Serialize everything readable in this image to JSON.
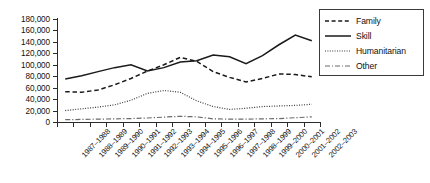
{
  "chart_data": {
    "type": "line",
    "title": "",
    "xlabel": "",
    "ylabel": "",
    "ylim": [
      0,
      180000
    ],
    "ytick_step": 20000,
    "grid": false,
    "legend_position": "right-top",
    "yticks": [
      "180,000",
      "160,000",
      "140,000",
      "120,000",
      "100,000",
      "80,000",
      "60,000",
      "40,000",
      "20,000",
      "0"
    ],
    "categories": [
      "1987–1988",
      "1988–1989",
      "1989–1990",
      "1990–1991",
      "1991–1992",
      "1992–1993",
      "1993–1994",
      "1994–1995",
      "1995–1996",
      "1996–1997",
      "1997–1998",
      "1998–1999",
      "1999–2000",
      "2000–2001",
      "2001–2002",
      "2002–2003"
    ],
    "series": [
      {
        "name": "Family",
        "style": "dashed",
        "color": "#1a1a1a",
        "values": [
          53000,
          52000,
          56000,
          65000,
          76000,
          89000,
          100000,
          113000,
          106000,
          88000,
          78000,
          70000,
          76000,
          84000,
          83000,
          79000
        ]
      },
      {
        "name": "Skill",
        "style": "solid",
        "color": "#1a1a1a",
        "values": [
          75000,
          81000,
          88000,
          95000,
          100000,
          89000,
          95000,
          105000,
          107000,
          117000,
          114000,
          102000,
          116000,
          135000,
          152000,
          142000
        ]
      },
      {
        "name": "Humanitarian",
        "style": "dotted",
        "color": "#3a3a3a",
        "values": [
          20000,
          23000,
          26000,
          30000,
          38000,
          50000,
          55000,
          52000,
          37000,
          27000,
          22000,
          24000,
          27000,
          28000,
          29000,
          31000
        ]
      },
      {
        "name": "Other",
        "style": "dashdot",
        "color": "#6a6a6a",
        "values": [
          4000,
          4500,
          5000,
          5500,
          6000,
          7000,
          8500,
          10000,
          9000,
          5500,
          5000,
          5000,
          5500,
          6000,
          7500,
          9000
        ]
      }
    ]
  },
  "legend": {
    "items": [
      {
        "label": "Family"
      },
      {
        "label": "Skill"
      },
      {
        "label": "Humanitarian"
      },
      {
        "label": "Other"
      }
    ]
  }
}
